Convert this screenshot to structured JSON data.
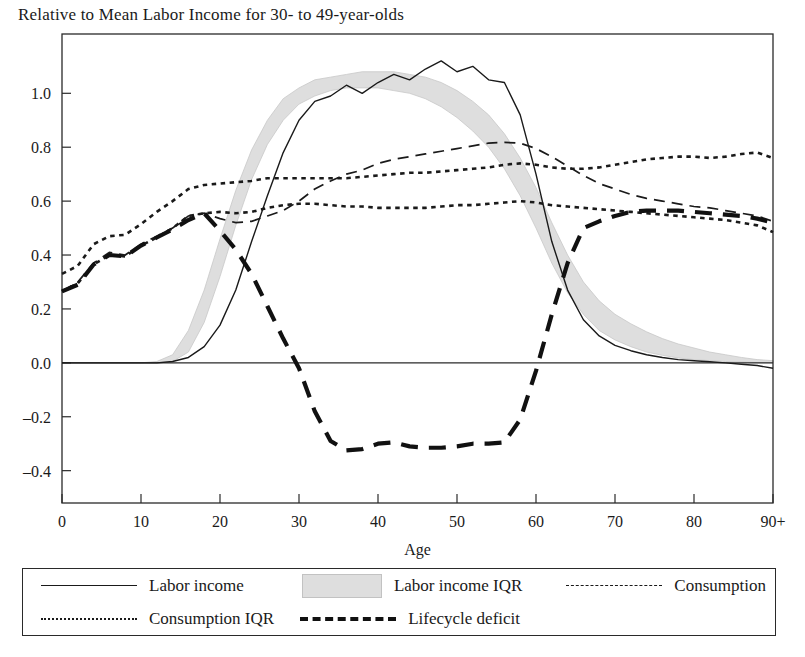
{
  "chart_data": {
    "type": "line",
    "title": "Relative to Mean Labor Income for 30- to 49-year-olds",
    "xlabel": "Age",
    "ylabel": "",
    "xlim": [
      0,
      90
    ],
    "ylim": [
      -0.52,
      1.22
    ],
    "xticks": [
      "0",
      "10",
      "20",
      "30",
      "40",
      "50",
      "60",
      "70",
      "80",
      "90+"
    ],
    "xtick_values": [
      0,
      10,
      20,
      30,
      40,
      50,
      60,
      70,
      80,
      90
    ],
    "yticks": [
      "1.0",
      "0.8",
      "0.6",
      "0.4",
      "0.2",
      "0.0",
      "-0.2",
      "-0.4"
    ],
    "ytick_values": [
      1.0,
      0.8,
      0.6,
      0.4,
      0.2,
      0.0,
      -0.2,
      -0.4
    ],
    "grid": false,
    "zero_line": true,
    "legend_position": "bottom",
    "x": [
      0,
      2,
      4,
      6,
      8,
      10,
      12,
      14,
      16,
      18,
      20,
      22,
      24,
      26,
      28,
      30,
      32,
      34,
      36,
      38,
      40,
      42,
      44,
      46,
      48,
      50,
      52,
      54,
      56,
      58,
      60,
      62,
      64,
      66,
      68,
      70,
      72,
      74,
      76,
      78,
      80,
      82,
      84,
      86,
      88,
      90
    ],
    "series": [
      {
        "name": "Labor income",
        "style": "solid-thin",
        "values": [
          0,
          0,
          0,
          0,
          0,
          0,
          0,
          0.005,
          0.02,
          0.06,
          0.14,
          0.27,
          0.45,
          0.62,
          0.78,
          0.9,
          0.97,
          0.99,
          1.03,
          1.0,
          1.04,
          1.07,
          1.05,
          1.09,
          1.12,
          1.08,
          1.1,
          1.05,
          1.04,
          0.92,
          0.7,
          0.45,
          0.27,
          0.16,
          0.1,
          0.065,
          0.045,
          0.03,
          0.02,
          0.012,
          0.008,
          0.004,
          0.0,
          -0.005,
          -0.01,
          -0.02
        ]
      },
      {
        "name": "Labor income IQR",
        "style": "gray-band",
        "upper": [
          0,
          0,
          0,
          0,
          0,
          0,
          0.005,
          0.03,
          0.12,
          0.27,
          0.46,
          0.64,
          0.79,
          0.9,
          0.98,
          1.02,
          1.05,
          1.06,
          1.07,
          1.08,
          1.08,
          1.08,
          1.07,
          1.06,
          1.04,
          1.01,
          0.97,
          0.92,
          0.85,
          0.76,
          0.65,
          0.52,
          0.4,
          0.3,
          0.23,
          0.18,
          0.145,
          0.115,
          0.09,
          0.07,
          0.055,
          0.04,
          0.03,
          0.02,
          0.012,
          0.008
        ],
        "lower": [
          0,
          0,
          0,
          0,
          0,
          0,
          0,
          0.005,
          0.04,
          0.15,
          0.32,
          0.51,
          0.68,
          0.81,
          0.9,
          0.96,
          0.99,
          1.01,
          1.02,
          1.02,
          1.02,
          1.01,
          1.0,
          0.98,
          0.95,
          0.91,
          0.86,
          0.8,
          0.72,
          0.62,
          0.5,
          0.37,
          0.26,
          0.18,
          0.12,
          0.085,
          0.06,
          0.04,
          0.028,
          0.018,
          0.012,
          0.008,
          0.005,
          0.003,
          0.001,
          0.0
        ]
      },
      {
        "name": "Consumption",
        "style": "dashed",
        "values": [
          0.265,
          0.3,
          0.37,
          0.41,
          0.4,
          0.44,
          0.47,
          0.5,
          0.545,
          0.555,
          0.535,
          0.52,
          0.525,
          0.545,
          0.565,
          0.6,
          0.645,
          0.675,
          0.7,
          0.715,
          0.74,
          0.755,
          0.765,
          0.775,
          0.785,
          0.795,
          0.805,
          0.815,
          0.818,
          0.815,
          0.795,
          0.765,
          0.73,
          0.695,
          0.665,
          0.645,
          0.625,
          0.61,
          0.6,
          0.59,
          0.58,
          0.575,
          0.565,
          0.555,
          0.545,
          0.525
        ]
      },
      {
        "name": "Consumption IQR",
        "style": "dotted",
        "upper": [
          0.33,
          0.36,
          0.44,
          0.47,
          0.475,
          0.515,
          0.56,
          0.6,
          0.645,
          0.66,
          0.665,
          0.67,
          0.675,
          0.685,
          0.685,
          0.685,
          0.685,
          0.685,
          0.685,
          0.69,
          0.695,
          0.7,
          0.705,
          0.705,
          0.71,
          0.715,
          0.72,
          0.725,
          0.735,
          0.74,
          0.735,
          0.725,
          0.72,
          0.72,
          0.725,
          0.735,
          0.745,
          0.755,
          0.76,
          0.765,
          0.765,
          0.76,
          0.765,
          0.775,
          0.78,
          0.76
        ],
        "lower": [
          0.265,
          0.295,
          0.365,
          0.4,
          0.395,
          0.435,
          0.465,
          0.5,
          0.545,
          0.555,
          0.56,
          0.555,
          0.56,
          0.575,
          0.585,
          0.59,
          0.59,
          0.585,
          0.58,
          0.58,
          0.575,
          0.575,
          0.575,
          0.575,
          0.58,
          0.585,
          0.585,
          0.59,
          0.595,
          0.6,
          0.595,
          0.585,
          0.58,
          0.575,
          0.57,
          0.565,
          0.56,
          0.555,
          0.55,
          0.545,
          0.54,
          0.535,
          0.53,
          0.52,
          0.51,
          0.485
        ]
      },
      {
        "name": "Lifecycle deficit",
        "style": "longdash-thick",
        "values": [
          0.265,
          0.29,
          0.365,
          0.4,
          0.395,
          0.435,
          0.465,
          0.495,
          0.53,
          0.555,
          0.49,
          0.42,
          0.33,
          0.21,
          0.09,
          -0.02,
          -0.18,
          -0.29,
          -0.325,
          -0.32,
          -0.3,
          -0.295,
          -0.31,
          -0.315,
          -0.315,
          -0.31,
          -0.3,
          -0.3,
          -0.295,
          -0.21,
          -0.03,
          0.18,
          0.37,
          0.5,
          0.525,
          0.545,
          0.56,
          0.565,
          0.565,
          0.565,
          0.56,
          0.555,
          0.55,
          0.545,
          0.535,
          0.52
        ]
      }
    ]
  },
  "legend": {
    "rows": [
      [
        {
          "label": "Labor income",
          "swatch": "solid"
        },
        {
          "label": "Labor income IQR",
          "swatch": "band"
        },
        {
          "label": "Consumption",
          "swatch": "dashed"
        }
      ],
      [
        {
          "label": "Consumption IQR",
          "swatch": "dotted"
        },
        {
          "label": "Lifecycle deficit",
          "swatch": "longdash"
        }
      ]
    ]
  },
  "colors": {
    "line": "#1a1a1a",
    "band": "#dedede",
    "band_edge": "#c8c8c8",
    "axis": "#2a2a2a",
    "background": "#ffffff"
  }
}
